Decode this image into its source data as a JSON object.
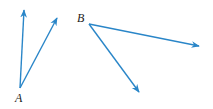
{
  "diagram": {
    "type": "angles",
    "ray_color": "#2a86c8",
    "angles": [
      {
        "vertex_label": "A",
        "vertex": [
          20,
          88
        ],
        "rays": [
          [
            24,
            10
          ],
          [
            57,
            18
          ]
        ],
        "label_pos": [
          15,
          102
        ]
      },
      {
        "vertex_label": "B",
        "vertex": [
          89,
          24
        ],
        "rays": [
          [
            199,
            46
          ],
          [
            139,
            92
          ]
        ],
        "label_pos": [
          77,
          22
        ]
      }
    ]
  }
}
